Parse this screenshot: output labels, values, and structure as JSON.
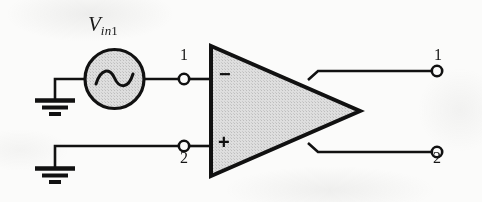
{
  "figure": {
    "kind": "schematic-diagram",
    "background_color": "#fbfbfa",
    "line_color": "#111111",
    "fill_gray": "#d4d4d4"
  },
  "source": {
    "label_prefix": "V",
    "label_subscript_letters": "in",
    "label_subscript_number": "1",
    "icon": "ac-sine-source-icon",
    "shape": "circle"
  },
  "amplifier": {
    "icon": "op-amp-triangle-icon",
    "inverting_sign": "−",
    "noninverting_sign": "+"
  },
  "grounds": [
    {
      "icon": "ground-icon",
      "name": "ground-upper"
    },
    {
      "icon": "ground-icon",
      "name": "ground-lower"
    }
  ],
  "terminals": {
    "inputs": [
      {
        "label": "1",
        "icon": "terminal-node-icon",
        "label_position": "above"
      },
      {
        "label": "2",
        "icon": "terminal-node-icon",
        "label_position": "below"
      }
    ],
    "outputs": [
      {
        "label": "1",
        "icon": "terminal-node-icon",
        "label_position": "above"
      },
      {
        "label": "2",
        "icon": "terminal-node-icon",
        "label_position": "below"
      }
    ]
  }
}
